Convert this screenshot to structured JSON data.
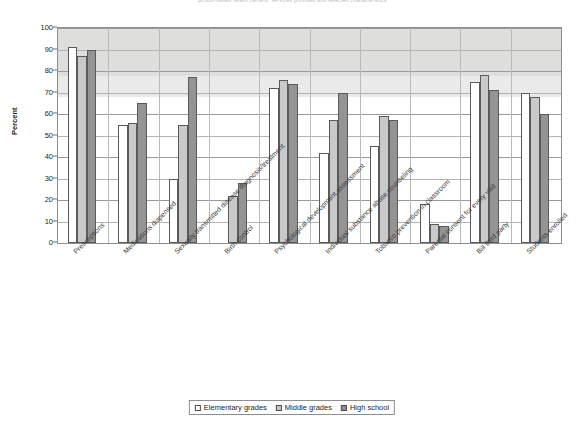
{
  "title": "School-based health centers: services provided and selected characteristics",
  "axis": {
    "ylabel": "Percent",
    "yticks": [
      0,
      10,
      20,
      30,
      40,
      50,
      60,
      70,
      80,
      90,
      100
    ]
  },
  "legend": {
    "items": [
      {
        "label": "Elementary grades",
        "color": "#ffffff",
        "swatch": "swatch-elementary"
      },
      {
        "label": "Middle grades",
        "color": "#c9c9c9",
        "swatch": "swatch-middle"
      },
      {
        "label": "High school",
        "color": "#8f8f8f",
        "swatch": "swatch-high"
      }
    ]
  },
  "chart_data": {
    "type": "bar",
    "title": "School-based health centers: services provided and selected characteristics",
    "xlabel": "",
    "ylabel": "Percent",
    "ylim": [
      0,
      100
    ],
    "ytick_step": 10,
    "grid": true,
    "legend_position": "bottom",
    "categories": [
      "Prescriptions",
      "Medications dispensed",
      "Sexually transmitted disease diagnosis/treatment",
      "Birth control",
      "Psychological development assessment",
      "Individual substance abuse counseling",
      "Tobacco prevention in classroom",
      "Parental consent for every visit",
      "Bill third party",
      "Students enrolled"
    ],
    "series": [
      {
        "name": "Elementary grades",
        "color": "#ffffff",
        "values": [
          91,
          55,
          30,
          0,
          72,
          42,
          45,
          18,
          75,
          70
        ]
      },
      {
        "name": "Middle grades",
        "color": "#c9c9c9",
        "values": [
          87,
          56,
          55,
          22,
          76,
          57,
          59,
          9,
          78,
          68
        ]
      },
      {
        "name": "High school",
        "color": "#949494",
        "values": [
          90,
          65,
          77,
          28,
          74,
          70,
          57,
          8,
          71,
          60
        ]
      }
    ]
  }
}
